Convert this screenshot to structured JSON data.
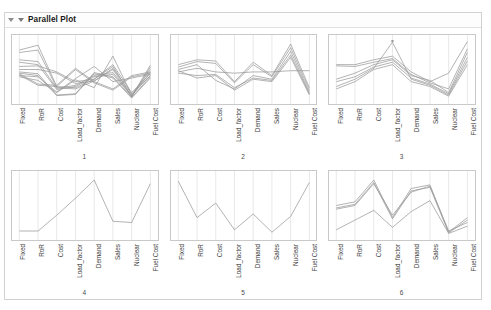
{
  "window": {
    "title": "Parallel Plot",
    "disclosure_icons": [
      "disclosure-triangle-outer",
      "disclosure-triangle-inner"
    ]
  },
  "chart_data": {
    "type": "line",
    "title": "Parallel Plot",
    "subtype": "parallel-coordinates",
    "xlabel": "",
    "ylabel": "",
    "grid": true,
    "legend": "none",
    "axes": [
      "Fixed",
      "RoR",
      "Cost",
      "Load_factor",
      "Demand",
      "Sales",
      "Nuclear",
      "Fuel Cost"
    ],
    "ylim": [
      0,
      1
    ],
    "panels": [
      {
        "number": "1",
        "series": [
          {
            "name": "s1",
            "values": [
              0.82,
              0.9,
              0.22,
              0.2,
              0.34,
              0.55,
              0.06,
              0.57
            ]
          },
          {
            "name": "s2",
            "values": [
              0.78,
              0.82,
              0.2,
              0.18,
              0.31,
              0.5,
              0.05,
              0.54
            ]
          },
          {
            "name": "s3",
            "values": [
              0.66,
              0.63,
              0.19,
              0.24,
              0.4,
              0.45,
              0.07,
              0.5
            ]
          },
          {
            "name": "s4",
            "values": [
              0.62,
              0.58,
              0.17,
              0.22,
              0.38,
              0.42,
              0.06,
              0.46
            ]
          },
          {
            "name": "s5",
            "values": [
              0.55,
              0.56,
              0.46,
              0.3,
              0.34,
              0.58,
              0.12,
              0.43
            ]
          },
          {
            "name": "s6",
            "values": [
              0.5,
              0.5,
              0.44,
              0.27,
              0.31,
              0.52,
              0.1,
              0.4
            ]
          },
          {
            "name": "s7",
            "values": [
              0.46,
              0.43,
              0.08,
              0.1,
              0.45,
              0.38,
              0.04,
              0.38
            ]
          },
          {
            "name": "s8",
            "values": [
              0.44,
              0.4,
              0.07,
              0.09,
              0.43,
              0.36,
              0.03,
              0.36
            ]
          },
          {
            "name": "s9",
            "values": [
              0.43,
              0.26,
              0.24,
              0.52,
              0.3,
              0.18,
              0.4,
              0.46
            ]
          },
          {
            "name": "s10",
            "values": [
              0.41,
              0.24,
              0.22,
              0.5,
              0.28,
              0.16,
              0.38,
              0.44
            ]
          },
          {
            "name": "s11",
            "values": [
              0.4,
              0.38,
              0.13,
              0.35,
              0.55,
              0.3,
              0.36,
              0.42
            ]
          },
          {
            "name": "s12",
            "values": [
              0.38,
              0.32,
              0.12,
              0.33,
              0.2,
              0.72,
              0.08,
              0.4
            ]
          }
        ]
      },
      {
        "number": "2",
        "series": [
          {
            "name": "s1",
            "values": [
              0.58,
              0.66,
              0.64,
              0.3,
              0.62,
              0.4,
              0.92,
              0.2
            ]
          },
          {
            "name": "s2",
            "values": [
              0.54,
              0.63,
              0.6,
              0.28,
              0.58,
              0.38,
              0.86,
              0.16
            ]
          },
          {
            "name": "s3",
            "values": [
              0.5,
              0.58,
              0.32,
              0.18,
              0.4,
              0.34,
              0.8,
              0.12
            ]
          },
          {
            "name": "s4",
            "values": [
              0.46,
              0.52,
              0.46,
              0.44,
              0.46,
              0.46,
              0.48,
              0.48
            ]
          },
          {
            "name": "s5",
            "values": [
              0.44,
              0.4,
              0.42,
              0.2,
              0.36,
              0.32,
              0.74,
              0.1
            ]
          },
          {
            "name": "s6",
            "values": [
              0.48,
              0.36,
              0.4,
              0.16,
              0.34,
              0.3,
              0.7,
              0.08
            ]
          }
        ]
      },
      {
        "number": "3",
        "series": [
          {
            "name": "s1",
            "values": [
              0.58,
              0.58,
              0.66,
              0.72,
              0.46,
              0.3,
              0.44,
              0.96
            ]
          },
          {
            "name": "s2",
            "values": [
              0.56,
              0.55,
              0.62,
              0.68,
              0.42,
              0.28,
              0.18,
              0.84
            ]
          },
          {
            "name": "s3",
            "values": [
              0.34,
              0.44,
              0.58,
              0.66,
              0.4,
              0.32,
              0.12,
              0.78
            ]
          },
          {
            "name": "s4",
            "values": [
              0.3,
              0.38,
              0.54,
              0.62,
              0.36,
              0.26,
              0.1,
              0.7
            ]
          },
          {
            "name": "s5",
            "values": [
              0.22,
              0.34,
              0.52,
              0.95,
              0.34,
              0.24,
              0.08,
              0.64
            ]
          },
          {
            "name": "s6",
            "values": [
              0.18,
              0.3,
              0.5,
              0.58,
              0.3,
              0.22,
              0.06,
              0.58
            ]
          }
        ],
        "markers": [
          {
            "axis": "Load_factor",
            "value": 0.97
          }
        ]
      },
      {
        "number": "4",
        "series": [
          {
            "name": "s1",
            "values": [
              0.08,
              0.08,
              0.34,
              0.62,
              0.92,
              0.24,
              0.22,
              0.86
            ]
          }
        ]
      },
      {
        "number": "5",
        "series": [
          {
            "name": "s1",
            "values": [
              0.9,
              0.3,
              0.54,
              0.1,
              0.36,
              0.06,
              0.32,
              0.88
            ]
          }
        ]
      },
      {
        "number": "6",
        "series": [
          {
            "name": "s1",
            "values": [
              0.5,
              0.56,
              0.92,
              0.3,
              0.78,
              0.84,
              0.06,
              0.3
            ]
          },
          {
            "name": "s2",
            "values": [
              0.46,
              0.52,
              0.88,
              0.28,
              0.74,
              0.8,
              0.05,
              0.26
            ]
          },
          {
            "name": "s3",
            "values": [
              0.44,
              0.5,
              0.86,
              0.34,
              0.72,
              0.82,
              0.08,
              0.22
            ]
          },
          {
            "name": "s4",
            "values": [
              0.1,
              0.26,
              0.42,
              0.14,
              0.4,
              0.58,
              0.04,
              0.16
            ]
          }
        ]
      }
    ]
  }
}
